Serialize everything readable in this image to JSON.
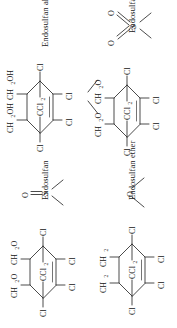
{
  "figure": {
    "type": "chemical-structure-grid",
    "rows": 2,
    "columns": 2,
    "orientation": "rotated-90-ccw",
    "background_color": "#ffffff",
    "line_color": "#2a2a2a",
    "text_color": "#141414"
  },
  "structures": [
    {
      "id": "endosulfan-alcohol",
      "caption": "Endosulfan alcohol",
      "position": "top-left",
      "core": "hexachloronorbornene",
      "bridge_label": "CCl",
      "bridge_sub": "2",
      "ring_substituents": [
        "Cl",
        "Cl",
        "Cl",
        "Cl"
      ],
      "side_groups": [
        {
          "label": "CH",
          "sub": "2",
          "tail": "OH"
        },
        {
          "label": "CH",
          "sub": "2",
          "tail": "OH"
        }
      ],
      "has_sulfur": false,
      "has_ether_oxygen": false
    },
    {
      "id": "endosulfan-sulfate",
      "caption": "Endosulfan sulfate",
      "position": "top-right",
      "core": "hexachloronorbornene",
      "bridge_label": "CCl",
      "bridge_sub": "2",
      "ring_substituents": [
        "Cl",
        "Cl",
        "Cl",
        "Cl"
      ],
      "side_groups": [
        {
          "label": "CH",
          "sub": "2",
          "tail": "O"
        },
        {
          "label": "CH",
          "sub": "2",
          "tail": "O"
        }
      ],
      "has_sulfur": true,
      "sulfur_label": "S",
      "sulfur_oxygens": [
        "O",
        "O"
      ],
      "sulfur_bond_type": "double",
      "has_ether_oxygen": false
    },
    {
      "id": "endosulfan",
      "caption": "Endosulfan",
      "position": "bottom-left",
      "core": "hexachloronorbornene",
      "bridge_label": "CCl",
      "bridge_sub": "2",
      "ring_substituents": [
        "Cl",
        "Cl",
        "Cl",
        "Cl"
      ],
      "side_groups": [
        {
          "label": "CH",
          "sub": "2",
          "tail": "O"
        },
        {
          "label": "CH",
          "sub": "2",
          "tail": "O"
        }
      ],
      "has_sulfur": true,
      "sulfur_label": "S",
      "sulfur_oxygens": [
        "O"
      ],
      "sulfur_bond_type": "double",
      "has_ether_oxygen": false
    },
    {
      "id": "endosulfan-ether",
      "caption": "Endosulfan ether",
      "position": "bottom-right",
      "core": "hexachloronorbornene",
      "bridge_label": "CCl",
      "bridge_sub": "2",
      "ring_substituents": [
        "Cl",
        "Cl",
        "Cl",
        "Cl"
      ],
      "side_groups": [
        {
          "label": "CH",
          "sub": "2",
          "tail": ""
        },
        {
          "label": "CH",
          "sub": "2",
          "tail": ""
        }
      ],
      "has_sulfur": false,
      "has_ether_oxygen": true,
      "ether_oxygen_label": "O"
    }
  ],
  "labels": {
    "chlorine": "Cl",
    "oxygen": "O",
    "sulfur": "S",
    "hydroxymethyl": "CH2OH",
    "methyleneoxy": "CH2O",
    "methylene": "CH2",
    "dichloromethano": "CCl2"
  }
}
